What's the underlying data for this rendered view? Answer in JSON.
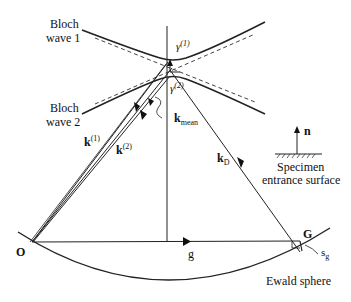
{
  "diagram": {
    "labels": {
      "bloch_wave_1_line1": "Bloch",
      "bloch_wave_1_line2": "wave 1",
      "bloch_wave_2_line1": "Bloch",
      "bloch_wave_2_line2": "wave 2",
      "gamma1_base": "γ",
      "gamma1_sup": "(1)",
      "gamma2_base": "γ",
      "gamma2_sup": "(2)",
      "k_mean_base": "k",
      "k_mean_sub": "mean",
      "k1_base": "k",
      "k1_sup": "(1)",
      "k2_base": "k",
      "k2_sup": "(2)",
      "kD_base": "k",
      "kD_sub": "D",
      "n": "n",
      "specimen_line1": "Specimen",
      "specimen_line2": "entrance surface",
      "origin": "O",
      "g_vector": "g",
      "G_point": "G",
      "sg_base": "s",
      "sg_sub": "g",
      "ewald_sphere": "Ewald sphere"
    },
    "colors": {
      "line": "#222222",
      "dashed": "#444444",
      "background": "#ffffff"
    }
  }
}
